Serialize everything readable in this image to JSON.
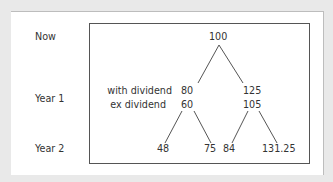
{
  "row_labels": {
    "now": "Now",
    "year1": "Year 1",
    "year2": "Year 2"
  },
  "annotations": {
    "with_dividend": "with dividend",
    "ex_dividend": "ex dividend"
  },
  "nodes": {
    "root": "100",
    "down_with": "80",
    "down_ex": "60",
    "up_with": "125",
    "up_ex": "105",
    "dd": "48",
    "du": "75",
    "ud": "84",
    "uu": "131.25"
  },
  "colors": {
    "background": "#e9e9e9",
    "card": "#ffffff",
    "line": "#555555",
    "text": "#333333"
  }
}
